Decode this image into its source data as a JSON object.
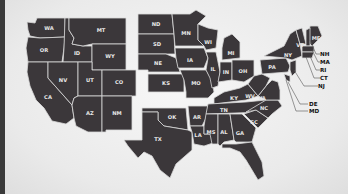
{
  "map": {
    "title": "United States",
    "fill_color": "#3b373a",
    "border_color": "#d9d9d9",
    "background_color": "#eeeeee",
    "states": [
      {
        "abbr": "WA"
      },
      {
        "abbr": "OR"
      },
      {
        "abbr": "CA"
      },
      {
        "abbr": "ID"
      },
      {
        "abbr": "NV"
      },
      {
        "abbr": "MT"
      },
      {
        "abbr": "WY"
      },
      {
        "abbr": "UT"
      },
      {
        "abbr": "AZ"
      },
      {
        "abbr": "CO"
      },
      {
        "abbr": "NM"
      },
      {
        "abbr": "ND"
      },
      {
        "abbr": "SD"
      },
      {
        "abbr": "NE"
      },
      {
        "abbr": "KS"
      },
      {
        "abbr": "OK"
      },
      {
        "abbr": "TX"
      },
      {
        "abbr": "MN"
      },
      {
        "abbr": "IA"
      },
      {
        "abbr": "MO"
      },
      {
        "abbr": "AR"
      },
      {
        "abbr": "LA"
      },
      {
        "abbr": "WI"
      },
      {
        "abbr": "IL"
      },
      {
        "abbr": "MI"
      },
      {
        "abbr": "IN"
      },
      {
        "abbr": "OH"
      },
      {
        "abbr": "KY"
      },
      {
        "abbr": "TN"
      },
      {
        "abbr": "MS"
      },
      {
        "abbr": "AL"
      },
      {
        "abbr": "GA"
      },
      {
        "abbr": "FL"
      },
      {
        "abbr": "SC"
      },
      {
        "abbr": "NC"
      },
      {
        "abbr": "VA"
      },
      {
        "abbr": "WV"
      },
      {
        "abbr": "PA"
      },
      {
        "abbr": "NY"
      },
      {
        "abbr": "VT"
      },
      {
        "abbr": "ME"
      }
    ],
    "external_labels": [
      {
        "abbr": "NH"
      },
      {
        "abbr": "MA"
      },
      {
        "abbr": "RI"
      },
      {
        "abbr": "CT"
      },
      {
        "abbr": "NJ"
      },
      {
        "abbr": "DE"
      },
      {
        "abbr": "MD"
      }
    ]
  }
}
